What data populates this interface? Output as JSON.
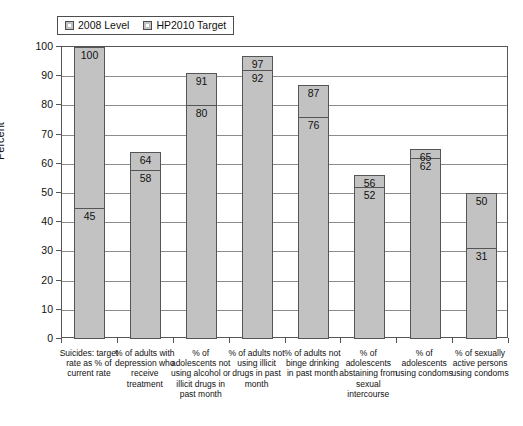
{
  "chart_data": {
    "type": "bar",
    "title": "",
    "subtitle": "",
    "xlabel": "",
    "ylabel": "Percent",
    "ylim": [
      0,
      100
    ],
    "ytick_labels": [
      "100",
      "90",
      "80",
      "70",
      "60",
      "50",
      "40",
      "30",
      "20",
      "10",
      "0"
    ],
    "ytick_values": [
      100,
      90,
      80,
      70,
      60,
      50,
      40,
      30,
      20,
      10,
      0
    ],
    "grid": true,
    "legend_position": "top-left",
    "categories": [
      "Suicides: target rate as % of current rate",
      "% of adults with depression who receive treatment",
      "% of adolescents not using alcohol or illicit drugs in past month",
      "% of adults not using illicit drugs in past month",
      "% of adults not binge drinking in past month",
      "% of adolescents abstaining from sexual intercourse",
      "% of adolescents using condoms",
      "% of sexually active persons using condoms"
    ],
    "series": [
      {
        "name": "2008 Level",
        "values": [
          100,
          64,
          91,
          97,
          87,
          56,
          65,
          50
        ]
      },
      {
        "name": "HP2010 Target",
        "values": [
          45,
          58,
          80,
          92,
          76,
          52,
          62,
          31
        ]
      }
    ],
    "colors": {
      "bar_fill": "#c2c2c2",
      "bar_edge": "#555555",
      "gridline": "#8c8c8c",
      "text": "#111111",
      "background": "#ffffff"
    }
  },
  "legend": {
    "entries": [
      {
        "label": "2008 Level"
      },
      {
        "label": "HP2010 Target"
      }
    ]
  },
  "axis": {
    "y_title": "Percent"
  }
}
